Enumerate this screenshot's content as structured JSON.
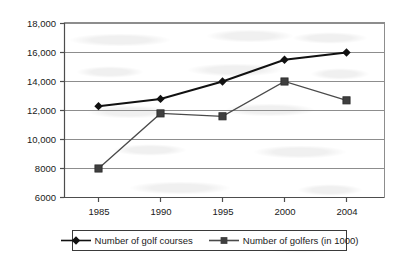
{
  "chart_data": {
    "type": "line",
    "title": "",
    "subtitle": "",
    "xlabel": "",
    "ylabel": "",
    "x": [
      1985,
      1990,
      1995,
      2000,
      2004
    ],
    "categories": [
      "1985",
      "1990",
      "1995",
      "2000",
      "2004"
    ],
    "series": [
      {
        "name": "Number of golf courses",
        "marker": "diamond",
        "color": "#111111",
        "values": [
          12300,
          12800,
          14000,
          15500,
          16000
        ]
      },
      {
        "name": "Number of golfers (in 1000)",
        "marker": "square",
        "color": "#4a4a4a",
        "values": [
          8000,
          11800,
          11600,
          14000,
          12700
        ]
      }
    ],
    "ylim": [
      6000,
      18000
    ],
    "ytick_values": [
      6000,
      8000,
      10000,
      12000,
      14000,
      16000,
      18000
    ],
    "ytick_labels": [
      "6000",
      "8000",
      "10,000",
      "12,000",
      "14,000",
      "16,000",
      "18,000"
    ],
    "xtick_labels": [
      "1985",
      "1990",
      "1995",
      "2000",
      "2004"
    ],
    "grid": "horizontal",
    "legend_position": "bottom",
    "legend_entries": [
      "Number of golf courses",
      "Number of golfers (in 1000)"
    ]
  },
  "axis": {
    "grid_color": "#9a9a9a",
    "axis_color": "#4d4d4d",
    "text_color": "#1a1a1a"
  }
}
